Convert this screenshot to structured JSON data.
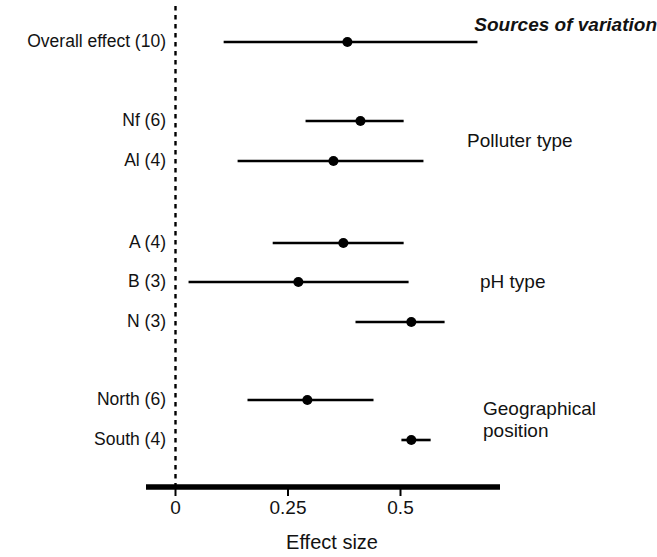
{
  "figure": {
    "header": "Sources of variation",
    "axis_title": "Effect size",
    "reference_line_value": 0
  },
  "chart_data": {
    "type": "scatter",
    "subtype": "forest-plot",
    "title": "Sources of variation",
    "xlabel": "Effect size",
    "ylabel": "",
    "xlim": [
      -0.065,
      0.722
    ],
    "xticks": [
      0,
      0.25,
      0.5
    ],
    "xtick_labels": [
      "0",
      "0.25",
      "0.5"
    ],
    "grid": false,
    "legend": false,
    "reference_line": 0,
    "reference_line_style": "dashed",
    "value_label": "Effect size (mean)",
    "interval_label": "95% confidence interval",
    "groups": [
      {
        "name": "Overall",
        "label": "",
        "rows": [
          {
            "label": "Overall effect (10)",
            "name": "Overall effect",
            "n": 10,
            "mean": 0.382,
            "ci_low": 0.107,
            "ci_high": 0.671
          }
        ]
      },
      {
        "name": "Polluter type",
        "label": "Polluter type",
        "rows": [
          {
            "label": "Nf (6)",
            "name": "Nf",
            "n": 6,
            "mean": 0.411,
            "ci_low": 0.289,
            "ci_high": 0.507
          },
          {
            "label": "Al (4)",
            "name": "Al",
            "n": 4,
            "mean": 0.351,
            "ci_low": 0.138,
            "ci_high": 0.551
          }
        ]
      },
      {
        "name": "pH type",
        "label": "pH type",
        "rows": [
          {
            "label": "A (4)",
            "name": "A",
            "n": 4,
            "mean": 0.373,
            "ci_low": 0.216,
            "ci_high": 0.507
          },
          {
            "label": "B (3)",
            "name": "B",
            "n": 3,
            "mean": 0.273,
            "ci_low": 0.029,
            "ci_high": 0.518
          },
          {
            "label": "N (3)",
            "name": "N",
            "n": 3,
            "mean": 0.524,
            "ci_low": 0.4,
            "ci_high": 0.598
          }
        ]
      },
      {
        "name": "Geographical position",
        "label": "Geographical\nposition",
        "rows": [
          {
            "label": "North (6)",
            "name": "North",
            "n": 6,
            "mean": 0.293,
            "ci_low": 0.16,
            "ci_high": 0.44
          },
          {
            "label": "South (4)",
            "name": "South",
            "n": 4,
            "mean": 0.524,
            "ci_low": 0.502,
            "ci_high": 0.567
          }
        ]
      }
    ]
  },
  "layout": {
    "row_y": {
      "Overall effect (10)": 42,
      "Nf (6)": 121,
      "Al (4)": 161,
      "A (4)": 243,
      "B (3)": 282,
      "N (3)": 322,
      "North (6)": 400,
      "South (4)": 440
    },
    "group_label_pos": {
      "Polluter type": {
        "x": 467,
        "y": 141
      },
      "pH type": {
        "x": 480,
        "y": 282
      },
      "Geographical position": {
        "x": 483,
        "y": 420
      }
    },
    "header_pos": {
      "x": 657,
      "y": 25
    },
    "label_right_x": 166,
    "axis": {
      "y": 487,
      "x_start": 146,
      "x_end": 500,
      "px_at_zero": 175.5,
      "px_per_unit": 450,
      "tick_len": 9,
      "tick_label_y": 498,
      "axis_title_x": 332,
      "axis_title_y": 532
    },
    "reference_line": {
      "x": 175.5,
      "y_top": 6,
      "y_bottom": 488
    }
  },
  "colors": {
    "ink": "#121212",
    "background": "#ffffff",
    "marker": "#000000",
    "axis": "#000000"
  }
}
